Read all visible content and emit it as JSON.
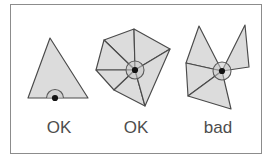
{
  "figure": {
    "width": 274,
    "height": 166,
    "background_color": "#ffffff",
    "frame": {
      "border_color": "#8c8c8c",
      "fill_color": "#ffffff",
      "x": 10,
      "y": 4,
      "width": 252,
      "height": 150
    },
    "style": {
      "face_fill": "#dcdcdc",
      "face_stroke": "#4a4a4a",
      "hub_stroke": "#5a5a5a",
      "hub_dot_color": "#121212",
      "caption_color": "#4d4d4d"
    }
  },
  "panels": [
    {
      "id": "panel-boundary-vertex",
      "caption": "OK",
      "caption_x": 59,
      "caption_y": 133,
      "vertex_kind": "boundary",
      "angle_marker": "semicircle",
      "triangle_count": 1,
      "faces": [
        {
          "id": "face-1",
          "points": "50,38 88,98 28,98"
        }
      ],
      "hub": {
        "cx": 55,
        "cy": 98,
        "radius": 8.5,
        "dot_radius": 3.1,
        "arc_path": "M 46.5,98 A 8.5,8.5 0 0 1 63.5,98"
      }
    },
    {
      "id": "panel-interior-fan",
      "caption": "OK",
      "caption_x": 136,
      "caption_y": 133,
      "vertex_kind": "interior-closed-fan",
      "angle_marker": "full-circle",
      "triangle_count": 5,
      "faces": [
        {
          "id": "face-1",
          "points": "135,70 134,29 104,40"
        },
        {
          "id": "face-2",
          "points": "135,70 104,40 96,70"
        },
        {
          "id": "face-3",
          "points": "135,70 96,70 114,90"
        },
        {
          "id": "face-4",
          "points": "135,70 114,90 145,106"
        },
        {
          "id": "face-5",
          "points": "135,70 134,29 170,49"
        },
        {
          "id": "face-6",
          "points": "135,70 170,49 145,106"
        }
      ],
      "hub": {
        "cx": 135,
        "cy": 70,
        "radius": 9.0,
        "dot_radius": 3.1
      }
    },
    {
      "id": "panel-nonmanifold-vertex",
      "caption": "bad",
      "caption_x": 218,
      "caption_y": 133,
      "vertex_kind": "non-manifold",
      "angle_marker": "full-circle",
      "triangle_count": 4,
      "faces": [
        {
          "id": "face-1",
          "points": "222,71 199,26 186,63"
        },
        {
          "id": "face-2",
          "points": "222,71 245,25 249,67"
        },
        {
          "id": "face-3",
          "points": "222,71 186,63 188,96"
        },
        {
          "id": "face-4",
          "points": "222,71 188,96 231,109"
        }
      ],
      "hub": {
        "cx": 222,
        "cy": 71,
        "radius": 9.0,
        "dot_radius": 3.1
      }
    }
  ]
}
